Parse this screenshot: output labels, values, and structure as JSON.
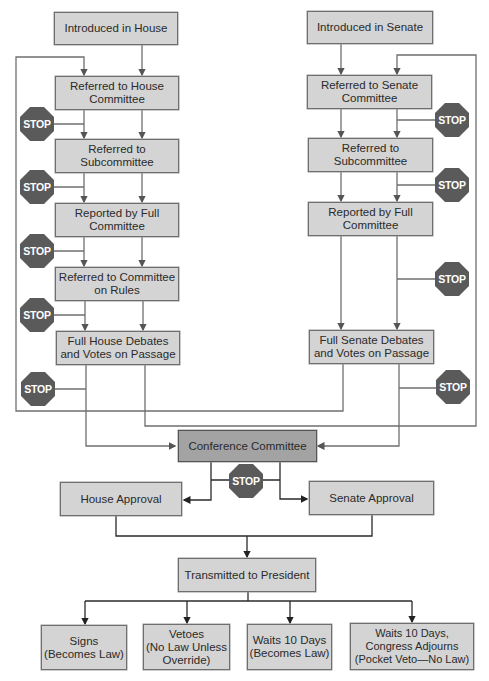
{
  "colors": {
    "box_fill": "#d4d4d4",
    "conference_fill": "#a3a3a3",
    "stop_fill": "#5a5a5a",
    "line": "#6f6f6f"
  },
  "house": {
    "introduced": "Introduced in House",
    "committee": "Referred to House\nCommittee",
    "subcommittee": "Referred to\nSubcommittee",
    "reported": "Reported by Full\nCommittee",
    "rules": "Referred to Committee\non Rules",
    "debate": "Full House Debates\nand Votes on Passage"
  },
  "senate": {
    "introduced": "Introduced in Senate",
    "committee": "Referred to Senate\nCommittee",
    "subcommittee": "Referred to\nSubcommittee",
    "reported": "Reported by Full\nCommittee",
    "debate": "Full Senate Debates\nand Votes on Passage"
  },
  "conference": "Conference Committee",
  "house_approval": "House Approval",
  "senate_approval": "Senate Approval",
  "president": "Transmitted to President",
  "outcomes": [
    "Signs\n(Becomes Law)",
    "Vetoes\n(No Law Unless\nOverride)",
    "Waits 10 Days\n(Becomes Law)",
    "Waits 10 Days,\nCongress Adjourns\n(Pocket Veto—No Law)"
  ],
  "stop_label": "STOP"
}
